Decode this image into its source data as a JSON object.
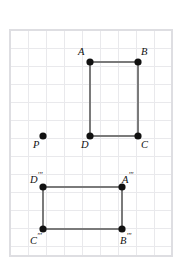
{
  "figure": {
    "canvas": {
      "width": 180,
      "height": 262,
      "background": "#ffffff"
    },
    "grid": {
      "cell_size": 18,
      "left": 10,
      "top": 30,
      "right": 172,
      "bottom": 256,
      "line_color": "#e9e9ec",
      "border_color": "#dedee2",
      "visible": true
    },
    "style": {
      "edge_color": "#7a7a7a",
      "edge_width": 2,
      "vertex_color": "#111111",
      "vertex_radius": 3.6,
      "label_color": "#111111",
      "label_font_size": "10.5px"
    },
    "shapes": [
      {
        "id": "rectangle-abcd",
        "name": "Rectangle ABCD",
        "closed": true,
        "vertices": [
          {
            "id": "A",
            "label": "A",
            "primes": "",
            "x": 90,
            "y": 62,
            "label_x": 78,
            "label_y": 47,
            "label_align": "right"
          },
          {
            "id": "B",
            "label": "B",
            "primes": "",
            "x": 138,
            "y": 62,
            "label_x": 141,
            "label_y": 47,
            "label_align": "left"
          },
          {
            "id": "C",
            "label": "C",
            "primes": "",
            "x": 138,
            "y": 136,
            "label_x": 141,
            "label_y": 140,
            "label_align": "left"
          },
          {
            "id": "D",
            "label": "D",
            "primes": "",
            "x": 90,
            "y": 136,
            "label_x": 81,
            "label_y": 140,
            "label_align": "left"
          }
        ]
      },
      {
        "id": "rectangle-abcd-triple-prime",
        "name": "Rectangle A''' B''' C''' D'''",
        "closed": true,
        "vertices": [
          {
            "id": "D3",
            "label": "D",
            "primes": "′′′",
            "x": 43,
            "y": 187,
            "label_x": 30,
            "label_y": 172,
            "label_align": "left"
          },
          {
            "id": "A3",
            "label": "A",
            "primes": "′′′",
            "x": 122,
            "y": 187,
            "label_x": 122,
            "label_y": 172,
            "label_align": "left"
          },
          {
            "id": "B3",
            "label": "B",
            "primes": "′′′",
            "x": 122,
            "y": 229,
            "label_x": 120,
            "label_y": 233,
            "label_align": "left"
          },
          {
            "id": "C3",
            "label": "C",
            "primes": "′′′",
            "x": 43,
            "y": 229,
            "label_x": 30,
            "label_y": 233,
            "label_align": "left"
          }
        ]
      }
    ],
    "points": [
      {
        "id": "P",
        "label": "P",
        "primes": "",
        "x": 43,
        "y": 136,
        "label_x": 33,
        "label_y": 140,
        "label_align": "left"
      }
    ]
  }
}
